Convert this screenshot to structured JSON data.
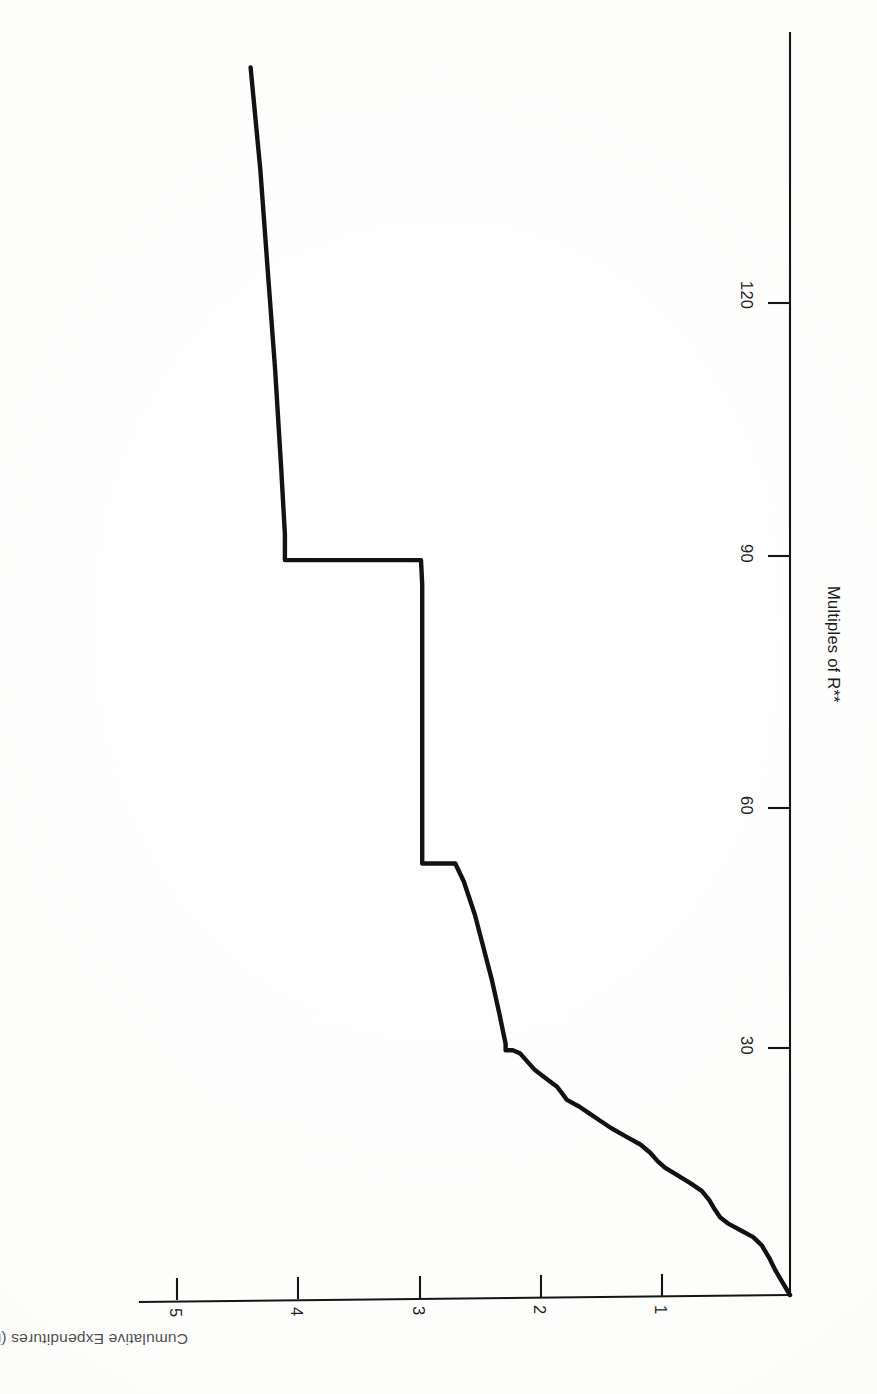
{
  "figure": {
    "orientation": "rotated-90-clockwise",
    "background_color": "#ffffff",
    "ink_color": "#121212"
  },
  "axes": {
    "x": {
      "title": "Multiples of R**",
      "title_plain": "Multiples of R",
      "title_superscript": "**",
      "ticks": [
        {
          "label": "30",
          "value": 30
        },
        {
          "label": "60",
          "value": 60
        },
        {
          "label": "90",
          "value": 90
        },
        {
          "label": "120",
          "value": 120
        }
      ],
      "range": [
        0,
        150
      ]
    },
    "y": {
      "title": "Cumulative Expenditures (in millions of dollars)",
      "ticks": [
        {
          "label": "1",
          "value": 1
        },
        {
          "label": "2",
          "value": 2
        },
        {
          "label": "3",
          "value": 3
        },
        {
          "label": "4",
          "value": 4
        },
        {
          "label": "5",
          "value": 5
        }
      ],
      "range": [
        0,
        5.6
      ]
    }
  },
  "chart_data": {
    "type": "line",
    "title": "",
    "subtitle": "",
    "xlabel": "Multiples of R**",
    "ylabel": "Cumulative Expenditures (in millions of dollars)",
    "xlim": [
      0,
      150
    ],
    "ylim": [
      0,
      5.6
    ],
    "grid": false,
    "legend": null,
    "legend_position": "none",
    "orientation_note": "Plot is printed rotated 90 degrees clockwise on the page; x axis runs bottom-to-top along the right edge, y axis runs right-to-left along the bottom edge.",
    "series": [
      {
        "name": "Cumulative Expenditures",
        "style": "step-with-smooth-segments",
        "color": "#121212",
        "x": [
          0,
          1.5,
          3.0,
          4.5,
          6.0,
          7.0,
          7.8,
          8.6,
          9.4,
          10.5,
          11.5,
          12.6,
          13.6,
          14.6,
          15.4,
          16.2,
          17.2,
          18.2,
          19.2,
          20.2,
          21.2,
          22.0,
          22.8,
          23.6,
          24.4,
          25.2,
          26.2,
          27.2,
          28.2,
          29.2,
          29.6,
          29.6,
          30.4,
          34.0,
          38.0,
          42.0,
          46.0,
          50.0,
          52.2,
          52.2,
          55.0,
          62.0,
          70.0,
          78.0,
          86.0,
          88.9,
          88.9,
          92.0,
          100.0,
          112.0,
          124.0,
          136.0,
          148.5
        ],
        "y": [
          0.0,
          0.06,
          0.12,
          0.17,
          0.23,
          0.3,
          0.4,
          0.5,
          0.57,
          0.62,
          0.66,
          0.72,
          0.82,
          0.93,
          1.02,
          1.08,
          1.14,
          1.22,
          1.34,
          1.46,
          1.56,
          1.64,
          1.72,
          1.82,
          1.86,
          1.9,
          1.99,
          2.08,
          2.14,
          2.2,
          2.26,
          2.32,
          2.32,
          2.37,
          2.43,
          2.5,
          2.57,
          2.66,
          2.73,
          3.0,
          3.0,
          3.0,
          3.0,
          3.0,
          3.0,
          3.01,
          4.12,
          4.12,
          4.15,
          4.2,
          4.26,
          4.32,
          4.4
        ]
      }
    ],
    "key_features": [
      {
        "description": "smooth rise from origin",
        "x_range": [
          0,
          29.6
        ],
        "y_range": [
          0.0,
          2.32
        ]
      },
      {
        "description": "first large vertical jump",
        "x": 29.6,
        "y_from": 2.2,
        "y_to": 2.32
      },
      {
        "description": "vertical jump to plateau near 3.0",
        "x": 52.2,
        "y_from": 2.73,
        "y_to": 3.0
      },
      {
        "description": "flat plateau at 3.0",
        "x_range": [
          52.2,
          88.9
        ],
        "y": 3.0
      },
      {
        "description": "large vertical jump",
        "x": 88.9,
        "y_from": 3.0,
        "y_to": 4.12
      },
      {
        "description": "gentle rise along top",
        "x_range": [
          88.9,
          148.5
        ],
        "y_range": [
          4.12,
          4.4
        ]
      }
    ]
  }
}
